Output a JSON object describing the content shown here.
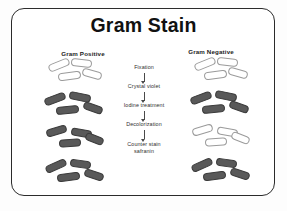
{
  "slide": {
    "title": "Gram Stain",
    "frame_border_color": "#2b2b2b",
    "background_color": "#ffffff"
  },
  "columns": {
    "positive": {
      "heading": "Gram Positive"
    },
    "negative": {
      "heading": "Gram Negative"
    }
  },
  "process": {
    "steps": [
      {
        "label": "Fixation"
      },
      {
        "label": "Crystal violet"
      },
      {
        "label": "Iodine treatment"
      },
      {
        "label": "Decolorization"
      },
      {
        "label": "Counter stain\nsafranin"
      }
    ],
    "arrow_icon": "arrow-down-icon"
  },
  "cell_states": {
    "stain_dark_color": "#595959",
    "stain_clear_color": "#ffffff",
    "gram_positive": [
      "clear",
      "dark",
      "dark",
      "dark"
    ],
    "gram_negative": [
      "clear",
      "dark",
      "clear",
      "dark"
    ]
  }
}
